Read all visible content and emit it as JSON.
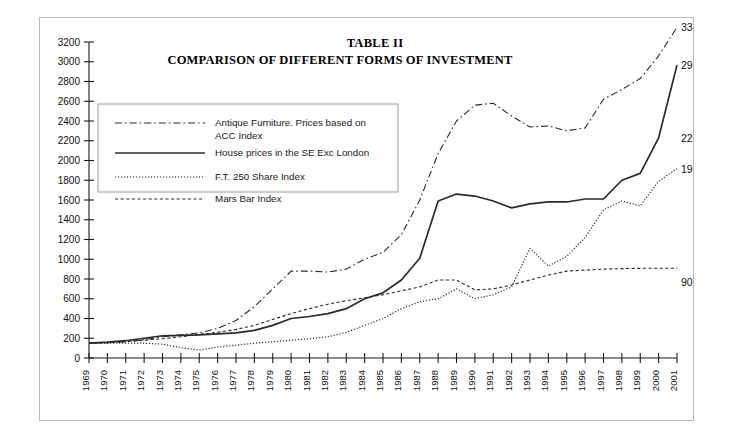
{
  "figure": {
    "title_line1": "TABLE II",
    "title_line2": "COMPARISON OF DIFFERENT FORMS OF INVESTMENT"
  },
  "legend": {
    "position": "upper-left-inside",
    "items": [
      {
        "label_line1": "Antique Furniture. Prices based on",
        "label_line2": "ACC Index",
        "style": "dash-dot"
      },
      {
        "label_line1": "House prices in the SE Exc London",
        "label_line2": "",
        "style": "solid"
      },
      {
        "label_line1": "F.T. 250 Share Index",
        "label_line2": "",
        "style": "dotted"
      },
      {
        "label_line1": "Mars Bar Index",
        "label_line2": "",
        "style": "dashed"
      }
    ]
  },
  "end_labels": [
    {
      "text": "3349",
      "series": "Antique Furniture"
    },
    {
      "text": "2966",
      "series": "House prices in the SE Exc London"
    },
    {
      "text": "2230",
      "series": "F.T. 250 Share Index"
    },
    {
      "text": "1916",
      "series": "Mars Bar Index"
    },
    {
      "text": "909",
      "series": "Mars Bar Index plateau"
    }
  ],
  "chart_data": {
    "type": "line",
    "xlabel": "",
    "ylabel": "",
    "grid": false,
    "legend_position": "upper left (inside axes)",
    "xlim": [
      1969,
      2001
    ],
    "ylim": [
      0,
      3200
    ],
    "ytick_step": 200,
    "yticks": [
      0,
      200,
      400,
      600,
      800,
      1000,
      1200,
      1400,
      1600,
      1800,
      2000,
      2200,
      2400,
      2600,
      2800,
      3000,
      3200
    ],
    "categories": [
      "1969",
      "1970",
      "1971",
      "1972",
      "1973",
      "1974",
      "1975",
      "1976",
      "1977",
      "1978",
      "1979",
      "1980",
      "1981",
      "1982",
      "1983",
      "1984",
      "1985",
      "1986",
      "1987",
      "1988",
      "1989",
      "1990",
      "1991",
      "1992",
      "1993",
      "1994",
      "1995",
      "1996",
      "1997",
      "1998",
      "1999",
      "2000",
      "2001"
    ],
    "series": [
      {
        "name": "Antique Furniture. Prices based on ACC Index",
        "style": "dash-dot",
        "final_value": 3349,
        "values": [
          150,
          155,
          165,
          185,
          215,
          235,
          255,
          300,
          380,
          520,
          700,
          880,
          880,
          870,
          900,
          1000,
          1070,
          1250,
          1600,
          2070,
          2400,
          2560,
          2580,
          2450,
          2340,
          2350,
          2300,
          2330,
          2620,
          2720,
          2830,
          3060,
          3349
        ]
      },
      {
        "name": "House prices in the SE Exc London",
        "style": "solid",
        "final_value": 2966,
        "values": [
          150,
          160,
          175,
          200,
          225,
          230,
          235,
          245,
          255,
          280,
          330,
          400,
          420,
          450,
          500,
          600,
          660,
          790,
          1010,
          1590,
          1660,
          1640,
          1590,
          1520,
          1560,
          1580,
          1580,
          1610,
          1610,
          1800,
          1870,
          2230,
          2966
        ]
      },
      {
        "name": "F.T. 250 Share Index",
        "style": "dotted",
        "final_value": 1916,
        "values": [
          150,
          150,
          150,
          150,
          140,
          105,
          80,
          110,
          130,
          150,
          165,
          180,
          195,
          215,
          260,
          330,
          400,
          500,
          570,
          600,
          700,
          600,
          640,
          720,
          1110,
          930,
          1030,
          1220,
          1500,
          1590,
          1540,
          1790,
          1916
        ]
      },
      {
        "name": "Mars Bar Index",
        "style": "dashed",
        "final_value": 909,
        "values": [
          150,
          155,
          165,
          180,
          195,
          215,
          240,
          260,
          290,
          330,
          390,
          450,
          500,
          545,
          580,
          610,
          640,
          680,
          720,
          790,
          790,
          690,
          700,
          740,
          790,
          840,
          880,
          890,
          900,
          905,
          908,
          909,
          909
        ]
      }
    ]
  }
}
